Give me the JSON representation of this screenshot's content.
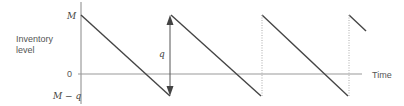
{
  "diagram": {
    "y_axis_label_line1": "Inventory",
    "y_axis_label_line2": "level",
    "x_axis_label": "Time",
    "y_ticks": {
      "top": "M",
      "zero": "0",
      "bottom": "M − q"
    },
    "arrow_label": "q",
    "colors": {
      "line": "#444444",
      "axis": "#888888",
      "dotted": "#aaaaaa",
      "text": "#555555"
    },
    "geometry": {
      "axis_x": 81,
      "y_M": 15,
      "y_zero": 74,
      "y_Mq": 96,
      "cycles": [
        {
          "peak_x": 81,
          "trough_x": 170
        },
        {
          "peak_x": 171,
          "trough_x": 261
        },
        {
          "peak_x": 262,
          "trough_x": 348
        },
        {
          "peak_x": 349,
          "end_x": 366,
          "end_y": 34
        }
      ]
    }
  }
}
